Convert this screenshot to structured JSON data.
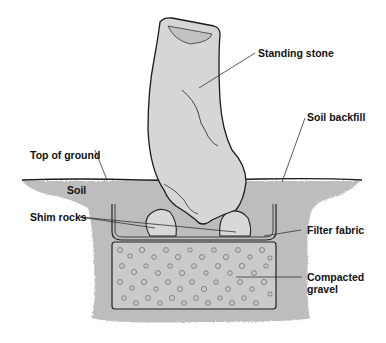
{
  "diagram": {
    "labels": {
      "standing_stone": "Standing stone",
      "soil_backfill": "Soil backfill",
      "top_of_ground": "Top of ground",
      "soil": "Soil",
      "shim_rocks": "Shim rocks",
      "filter_fabric": "Filter fabric",
      "compacted_gravel_line1": "Compacted",
      "compacted_gravel_line2": "gravel"
    },
    "colors": {
      "background": "#ffffff",
      "soil": "#b9b9b9",
      "stone": "#d4d4d4",
      "gravel": "#c4c4c4",
      "outline": "#1a1a1a",
      "leader": "#333333"
    }
  }
}
